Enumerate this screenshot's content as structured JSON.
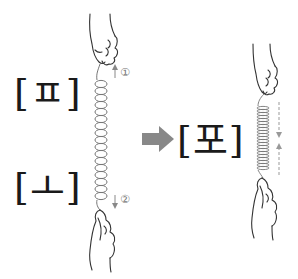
{
  "diagram": {
    "left_top_label": "[ㅍ]",
    "left_bottom_label": "[ㅗ]",
    "right_label": "[포]",
    "step_up": "①",
    "step_down": "②",
    "colors": {
      "arrow": "#888888",
      "line": "#333333",
      "spring": "#777777",
      "text": "#1a1a1a"
    }
  }
}
